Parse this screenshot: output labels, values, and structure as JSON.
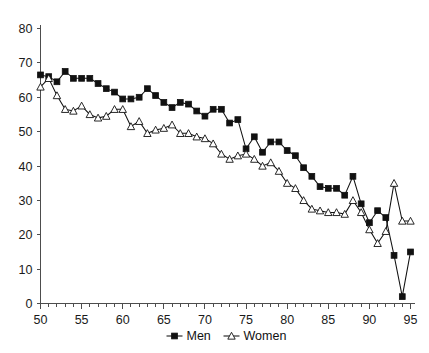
{
  "chart_data": {
    "type": "line",
    "title": "",
    "subtitle": "",
    "xlabel": "",
    "ylabel": "",
    "xlim": [
      50,
      95
    ],
    "ylim": [
      0,
      80
    ],
    "xticks": [
      50,
      55,
      60,
      65,
      70,
      75,
      80,
      85,
      90,
      95
    ],
    "yticks": [
      0,
      10,
      20,
      30,
      40,
      50,
      60,
      70,
      80
    ],
    "xtick_labels": [
      "50",
      "55",
      "60",
      "65",
      "70",
      "75",
      "80",
      "85",
      "90",
      "95"
    ],
    "ytick_labels": [
      "0",
      "10",
      "20",
      "30",
      "40",
      "50",
      "60",
      "70",
      "80"
    ],
    "x_minor_tick_step": 1,
    "grid": false,
    "legend_position": "bottom-center",
    "x": [
      50,
      51,
      52,
      53,
      54,
      55,
      56,
      57,
      58,
      59,
      60,
      61,
      62,
      63,
      64,
      65,
      66,
      67,
      68,
      69,
      70,
      71,
      72,
      73,
      74,
      75,
      76,
      77,
      78,
      79,
      80,
      81,
      82,
      83,
      84,
      85,
      86,
      87,
      88,
      89,
      90,
      91,
      92,
      93,
      94,
      95
    ],
    "series": [
      {
        "name": "Men",
        "marker": "filled-square",
        "color": "#111111",
        "values": [
          66.5,
          66.0,
          64.5,
          67.5,
          65.5,
          65.5,
          65.5,
          64.0,
          62.5,
          61.5,
          59.5,
          59.5,
          60.0,
          62.5,
          60.5,
          58.5,
          57.0,
          58.5,
          58.0,
          56.0,
          54.5,
          56.5,
          56.5,
          52.5,
          53.5,
          45.0,
          48.5,
          44.0,
          47.0,
          47.0,
          44.5,
          43.0,
          39.5,
          37.0,
          34.0,
          33.5,
          33.5,
          31.5,
          37.0,
          29.0,
          23.5,
          27.0,
          25.0,
          14.0,
          2.0,
          15.0
        ]
      },
      {
        "name": "Women",
        "marker": "open-triangle",
        "color": "#111111",
        "values": [
          63.0,
          65.5,
          60.5,
          56.5,
          56.0,
          57.5,
          55.0,
          54.0,
          54.5,
          56.5,
          56.5,
          51.5,
          53.0,
          49.5,
          50.5,
          51.0,
          52.0,
          49.5,
          49.5,
          48.5,
          48.0,
          46.5,
          43.5,
          42.0,
          43.0,
          43.5,
          42.0,
          40.0,
          41.0,
          38.5,
          35.0,
          33.5,
          30.0,
          27.5,
          27.0,
          26.5,
          26.5,
          26.0,
          30.0,
          26.5,
          21.5,
          17.5,
          21.0,
          35.0,
          24.0,
          24.0
        ]
      }
    ],
    "legend": [
      {
        "label": "Men",
        "marker": "filled-square"
      },
      {
        "label": "Women",
        "marker": "open-triangle"
      }
    ]
  },
  "axes": {
    "y_axis_name": "value-axis",
    "x_axis_name": "year-axis"
  }
}
